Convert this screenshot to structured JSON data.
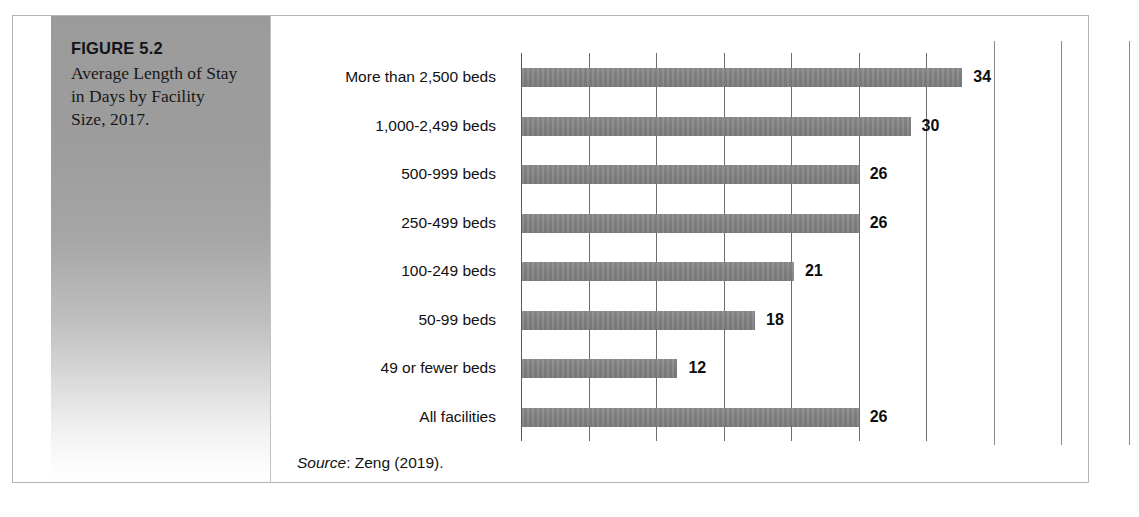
{
  "figure": {
    "number_label": "FIGURE 5.2",
    "caption": "Average Length of Stay in Days by Facility Size, 2017."
  },
  "source_note": {
    "label": "Source",
    "text": ": Zeng (2019)."
  },
  "colors": {
    "bar_fill": "#848484",
    "gridline": "#6e6e6e",
    "axis": "#5a5a5a",
    "panel_gradient_top": "#9b9b9b",
    "panel_gradient_bottom": "#ffffff",
    "frame_border": "#b4b4b4",
    "text": "#111111"
  },
  "chart_data": {
    "type": "bar",
    "orientation": "horizontal",
    "title": "Average Length of Stay in Days by Facility Size, 2017.",
    "xlabel": "",
    "ylabel": "",
    "xlim": [
      0,
      45
    ],
    "grid": true,
    "gridline_count": 10,
    "legend": "none",
    "categories": [
      "More than 2,500 beds",
      "1,000-2,499 beds",
      "500-999 beds",
      "250-499 beds",
      "100-249 beds",
      "50-99 beds",
      "49 or fewer beds",
      "All facilities"
    ],
    "values": [
      34,
      30,
      26,
      26,
      21,
      18,
      12,
      26
    ],
    "data_labels": [
      "34",
      "30",
      "26",
      "26",
      "21",
      "18",
      "12",
      "26"
    ],
    "units": "days"
  }
}
